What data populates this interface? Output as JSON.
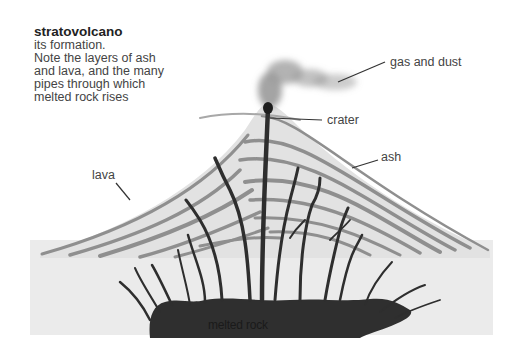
{
  "diagram": {
    "title": "stratovolcano",
    "description": "its formation.\nNote the layers of ash\nand lava, and the many\npipes through which\nmelted rock rises",
    "labels": {
      "gas": "gas and dust",
      "crater": "crater",
      "ash": "ash",
      "lava": "lava",
      "magma": "melted rock"
    },
    "colors": {
      "background": "#ffffff",
      "ground": "#ebebeb",
      "cone": "#e2e2e2",
      "lava_layer": "#8f8f8f",
      "pipe": "#2e2e2e",
      "magma": "#2f2f2f",
      "smoke": "#9a9a9a"
    }
  }
}
